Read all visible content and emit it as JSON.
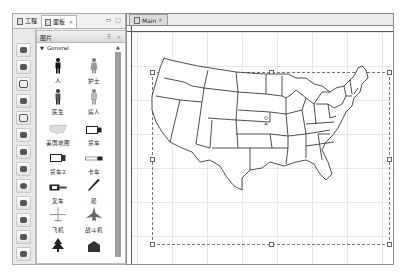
{
  "left_view": {
    "tabs": [
      {
        "label": "工程",
        "icon": "project-icon",
        "active": false
      },
      {
        "label": "面板",
        "icon": "palette-icon",
        "active": true,
        "close": "✕"
      }
    ],
    "window_controls": "▭ ▢"
  },
  "icon_strip": {
    "items": [
      "figure-icon",
      "book-icon",
      "shape-icon",
      "chart-icon",
      "frame-icon",
      "arrow-icon",
      "arrow2-icon",
      "group-icon",
      "sphere-icon",
      "leaf-icon",
      "mountain-icon",
      "tree-icon",
      "building-icon",
      "folder-icon"
    ]
  },
  "palette": {
    "title": "图片",
    "header_controls": "⠿ ⌗",
    "drawer": {
      "label": "General",
      "expanded": true
    },
    "items": [
      {
        "label": "人",
        "icon": "person-icon"
      },
      {
        "label": "护士",
        "icon": "nurse-icon"
      },
      {
        "label": "医生",
        "icon": "doctor-icon"
      },
      {
        "label": "病人",
        "icon": "patient-icon"
      },
      {
        "label": "美国地图",
        "icon": "us-map-icon"
      },
      {
        "label": "货车",
        "icon": "van-icon"
      },
      {
        "label": "货车2",
        "icon": "van2-icon"
      },
      {
        "label": "卡车",
        "icon": "truck-icon"
      },
      {
        "label": "叉车",
        "icon": "forklift-icon"
      },
      {
        "label": "船",
        "icon": "ship-icon"
      },
      {
        "label": "飞机",
        "icon": "airplane-icon"
      },
      {
        "label": "战斗机",
        "icon": "fighter-jet-icon"
      },
      {
        "label": "",
        "icon": "tree-icon"
      },
      {
        "label": "",
        "icon": "building-icon"
      }
    ]
  },
  "editor": {
    "tab": {
      "label": "Main",
      "close": "✕"
    },
    "canvas": {
      "content": "us-map",
      "selected": true
    }
  }
}
